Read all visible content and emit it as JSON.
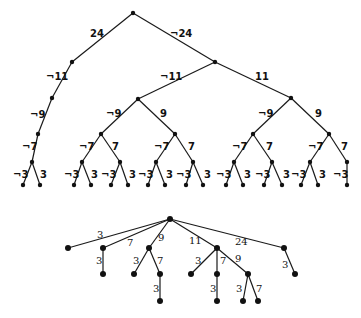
{
  "diagram": {
    "top_tree": {
      "nodes": [
        {
          "id": "r",
          "x": 133,
          "y": 13
        },
        {
          "id": "a",
          "x": 72,
          "y": 62
        },
        {
          "id": "b",
          "x": 215,
          "y": 62
        },
        {
          "id": "a1",
          "x": 52,
          "y": 98
        },
        {
          "id": "a2",
          "x": 38,
          "y": 134
        },
        {
          "id": "a3",
          "x": 32,
          "y": 162
        },
        {
          "id": "a4",
          "x": 23,
          "y": 185
        },
        {
          "id": "a5",
          "x": 40,
          "y": 185
        },
        {
          "id": "c",
          "x": 138,
          "y": 99
        },
        {
          "id": "d",
          "x": 291,
          "y": 98
        },
        {
          "id": "c1",
          "x": 101,
          "y": 134
        },
        {
          "id": "c2",
          "x": 175,
          "y": 134
        },
        {
          "id": "c11",
          "x": 82,
          "y": 162
        },
        {
          "id": "c12",
          "x": 120,
          "y": 162
        },
        {
          "id": "c111",
          "x": 74,
          "y": 185
        },
        {
          "id": "c112",
          "x": 91,
          "y": 185
        },
        {
          "id": "c121",
          "x": 111,
          "y": 185
        },
        {
          "id": "c122",
          "x": 128,
          "y": 185
        },
        {
          "id": "c21",
          "x": 156,
          "y": 162
        },
        {
          "id": "c22",
          "x": 193,
          "y": 162
        },
        {
          "id": "c211",
          "x": 148,
          "y": 185
        },
        {
          "id": "c212",
          "x": 165,
          "y": 185
        },
        {
          "id": "c221",
          "x": 186,
          "y": 185
        },
        {
          "id": "c222",
          "x": 203,
          "y": 185
        },
        {
          "id": "d1",
          "x": 253,
          "y": 134
        },
        {
          "id": "d2",
          "x": 329,
          "y": 134
        },
        {
          "id": "d11",
          "x": 234,
          "y": 162
        },
        {
          "id": "d12",
          "x": 272,
          "y": 162
        },
        {
          "id": "d111",
          "x": 226,
          "y": 185
        },
        {
          "id": "d112",
          "x": 243,
          "y": 185
        },
        {
          "id": "d121",
          "x": 264,
          "y": 185
        },
        {
          "id": "d122",
          "x": 282,
          "y": 185
        },
        {
          "id": "d21",
          "x": 310,
          "y": 162
        },
        {
          "id": "d22",
          "x": 347,
          "y": 162
        },
        {
          "id": "d211",
          "x": 301,
          "y": 185
        },
        {
          "id": "d212",
          "x": 318,
          "y": 185
        },
        {
          "id": "d221",
          "x": 347,
          "y": 185
        }
      ],
      "edges": [
        {
          "from": "r",
          "to": "a",
          "label": "24",
          "lx": 90,
          "ly": 37
        },
        {
          "from": "r",
          "to": "b",
          "label": "¬24",
          "lx": 170,
          "ly": 37
        },
        {
          "from": "a",
          "to": "a1",
          "label": "¬11",
          "lx": 46,
          "ly": 80
        },
        {
          "from": "a1",
          "to": "a2",
          "label": "¬9",
          "lx": 30,
          "ly": 118
        },
        {
          "from": "a2",
          "to": "a3",
          "label": "¬7",
          "lx": 22,
          "ly": 150
        },
        {
          "from": "a3",
          "to": "a4",
          "label": "¬3",
          "lx": 13,
          "ly": 178
        },
        {
          "from": "a3",
          "to": "a5",
          "label": "3",
          "lx": 40,
          "ly": 178
        },
        {
          "from": "b",
          "to": "c",
          "label": "¬11",
          "lx": 160,
          "ly": 80
        },
        {
          "from": "b",
          "to": "d",
          "label": "11",
          "lx": 255,
          "ly": 80
        },
        {
          "from": "c",
          "to": "c1",
          "label": "¬9",
          "lx": 106,
          "ly": 117
        },
        {
          "from": "c",
          "to": "c2",
          "label": "9",
          "lx": 160,
          "ly": 117
        },
        {
          "from": "c1",
          "to": "c11",
          "label": "¬7",
          "lx": 79,
          "ly": 150
        },
        {
          "from": "c1",
          "to": "c12",
          "label": "7",
          "lx": 112,
          "ly": 150
        },
        {
          "from": "c11",
          "to": "c111",
          "label": "¬3",
          "lx": 64,
          "ly": 178
        },
        {
          "from": "c11",
          "to": "c112",
          "label": "3",
          "lx": 91,
          "ly": 178
        },
        {
          "from": "c12",
          "to": "c121",
          "label": "¬3",
          "lx": 101,
          "ly": 178
        },
        {
          "from": "c12",
          "to": "c122",
          "label": "3",
          "lx": 129,
          "ly": 178
        },
        {
          "from": "c2",
          "to": "c21",
          "label": "¬7",
          "lx": 154,
          "ly": 150
        },
        {
          "from": "c2",
          "to": "c22",
          "label": "7",
          "lx": 188,
          "ly": 150
        },
        {
          "from": "c21",
          "to": "c211",
          "label": "¬3",
          "lx": 138,
          "ly": 178
        },
        {
          "from": "c21",
          "to": "c212",
          "label": "3",
          "lx": 166,
          "ly": 178
        },
        {
          "from": "c22",
          "to": "c221",
          "label": "¬3",
          "lx": 176,
          "ly": 178
        },
        {
          "from": "c22",
          "to": "c222",
          "label": "3",
          "lx": 204,
          "ly": 178
        },
        {
          "from": "d",
          "to": "d1",
          "label": "¬9",
          "lx": 258,
          "ly": 117
        },
        {
          "from": "d",
          "to": "d2",
          "label": "9",
          "lx": 315,
          "ly": 117
        },
        {
          "from": "d1",
          "to": "d11",
          "label": "¬7",
          "lx": 232,
          "ly": 150
        },
        {
          "from": "d1",
          "to": "d12",
          "label": "7",
          "lx": 266,
          "ly": 150
        },
        {
          "from": "d11",
          "to": "d111",
          "label": "¬3",
          "lx": 216,
          "ly": 178
        },
        {
          "from": "d11",
          "to": "d112",
          "label": "3",
          "lx": 244,
          "ly": 178
        },
        {
          "from": "d12",
          "to": "d121",
          "label": "¬3",
          "lx": 255,
          "ly": 178
        },
        {
          "from": "d12",
          "to": "d122",
          "label": "3",
          "lx": 283,
          "ly": 178
        },
        {
          "from": "d2",
          "to": "d21",
          "label": "¬7",
          "lx": 308,
          "ly": 150
        },
        {
          "from": "d2",
          "to": "d22",
          "label": "7",
          "lx": 341,
          "ly": 150
        },
        {
          "from": "d21",
          "to": "d211",
          "label": "¬3",
          "lx": 291,
          "ly": 178
        },
        {
          "from": "d21",
          "to": "d212",
          "label": "3",
          "lx": 319,
          "ly": 178
        },
        {
          "from": "d22",
          "to": "d221",
          "label": "¬3",
          "lx": 333,
          "ly": 178
        }
      ]
    },
    "bottom_tree": {
      "nodes": [
        {
          "id": "R",
          "x": 170,
          "y": 219
        },
        {
          "id": "n3",
          "x": 68,
          "y": 248
        },
        {
          "id": "n7",
          "x": 103,
          "y": 248
        },
        {
          "id": "n9",
          "x": 149,
          "y": 248
        },
        {
          "id": "n11",
          "x": 217,
          "y": 248
        },
        {
          "id": "n24",
          "x": 284,
          "y": 248
        },
        {
          "id": "n7_3",
          "x": 103,
          "y": 274
        },
        {
          "id": "n9_3",
          "x": 134,
          "y": 274
        },
        {
          "id": "n9_7",
          "x": 160,
          "y": 274
        },
        {
          "id": "n9_7_3",
          "x": 160,
          "y": 301
        },
        {
          "id": "n11_3",
          "x": 191,
          "y": 274
        },
        {
          "id": "n11_7",
          "x": 217,
          "y": 274
        },
        {
          "id": "n11_9",
          "x": 248,
          "y": 274
        },
        {
          "id": "n11_7_3",
          "x": 217,
          "y": 301
        },
        {
          "id": "n11_9_3",
          "x": 243,
          "y": 301
        },
        {
          "id": "n11_9_7",
          "x": 258,
          "y": 301
        },
        {
          "id": "n24_3",
          "x": 295,
          "y": 274
        }
      ],
      "edges": [
        {
          "from": "R",
          "to": "n3",
          "label": "3",
          "lx": 97,
          "ly": 238
        },
        {
          "from": "R",
          "to": "n7",
          "label": "7",
          "lx": 127,
          "ly": 246
        },
        {
          "from": "R",
          "to": "n9",
          "label": "9",
          "lx": 158,
          "ly": 241
        },
        {
          "from": "R",
          "to": "n11",
          "label": "11",
          "lx": 189,
          "ly": 244
        },
        {
          "from": "R",
          "to": "n24",
          "label": "24",
          "lx": 235,
          "ly": 245
        },
        {
          "from": "n7",
          "to": "n7_3",
          "label": "3",
          "lx": 96,
          "ly": 264
        },
        {
          "from": "n9",
          "to": "n9_3",
          "label": "3",
          "lx": 133,
          "ly": 264
        },
        {
          "from": "n9",
          "to": "n9_7",
          "label": "7",
          "lx": 157,
          "ly": 264
        },
        {
          "from": "n9_7",
          "to": "n9_7_3",
          "label": "3",
          "lx": 153,
          "ly": 292
        },
        {
          "from": "n11",
          "to": "n11_3",
          "label": "3",
          "lx": 195,
          "ly": 264
        },
        {
          "from": "n11",
          "to": "n11_7",
          "label": "7",
          "lx": 220,
          "ly": 264
        },
        {
          "from": "n11",
          "to": "n11_9",
          "label": "9",
          "lx": 235,
          "ly": 262
        },
        {
          "from": "n11_7",
          "to": "n11_7_3",
          "label": "3",
          "lx": 210,
          "ly": 292
        },
        {
          "from": "n11_9",
          "to": "n11_9_3",
          "label": "3",
          "lx": 236,
          "ly": 292
        },
        {
          "from": "n11_9",
          "to": "n11_9_7",
          "label": "7",
          "lx": 256,
          "ly": 292
        },
        {
          "from": "n24",
          "to": "n24_3",
          "label": "3",
          "lx": 282,
          "ly": 268
        }
      ]
    }
  }
}
